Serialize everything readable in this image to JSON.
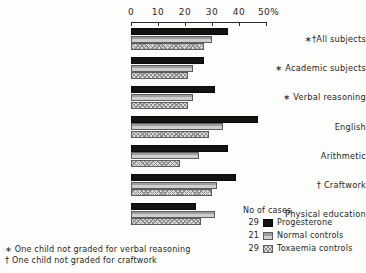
{
  "chart_data": {
    "type": "bar",
    "orientation": "horizontal",
    "title": "",
    "xlabel": "%",
    "ylabel": "",
    "xlim": [
      0,
      50
    ],
    "grid": false,
    "legend_position": "bottom-right",
    "legend_title": "No of cases",
    "ticks": [
      {
        "value": 0,
        "label": "0"
      },
      {
        "value": 10,
        "label": "10"
      },
      {
        "value": 20,
        "label": "20"
      },
      {
        "value": 30,
        "label": "30"
      },
      {
        "value": 40,
        "label": "40"
      },
      {
        "value": 50,
        "label": "50%"
      }
    ],
    "categories": [
      "∗†All subjects",
      "∗ Academic subjects",
      "∗ Verbal reasoning",
      "English",
      "Arithmetic",
      "† Craftwork",
      "Physical education"
    ],
    "series": [
      {
        "name": "Progesterone",
        "count": "29",
        "color": "#131313",
        "values": [
          36,
          27,
          31,
          47,
          36,
          39,
          24
        ]
      },
      {
        "name": "Normal controls",
        "count": "21",
        "color": "#9d9d9d",
        "values": [
          30,
          23,
          23,
          34,
          25,
          32,
          31
        ]
      },
      {
        "name": "Toxaemia controls",
        "count": "29",
        "color": "#dcdcdc",
        "values": [
          27,
          21,
          21,
          29,
          18,
          30,
          26
        ]
      }
    ],
    "footnotes": [
      "∗ One child not graded for verbal reasoning",
      "† One child not graded for craftwork"
    ]
  }
}
